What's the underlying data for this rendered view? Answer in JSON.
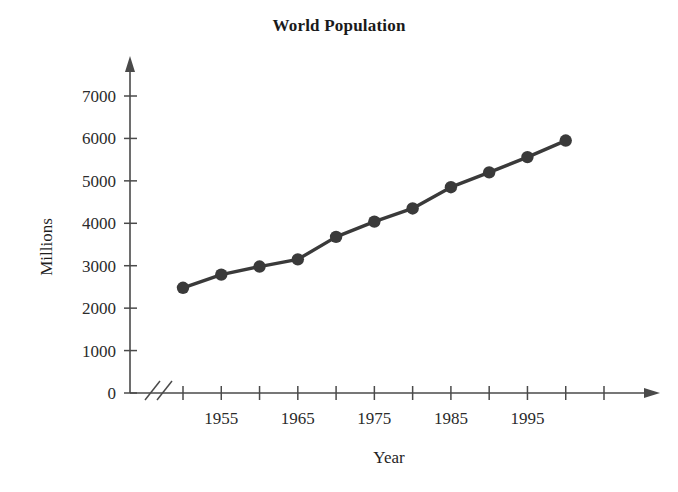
{
  "chart_data": {
    "type": "line",
    "title": "World Population",
    "xlabel": "Year",
    "ylabel": "Millions",
    "x": [
      1950,
      1955,
      1960,
      1965,
      1970,
      1975,
      1980,
      1985,
      1990,
      1995,
      2000
    ],
    "values": [
      2480,
      2790,
      2980,
      3150,
      3680,
      4040,
      4350,
      4850,
      5200,
      5560,
      5950
    ],
    "xlim": [
      1950,
      2005
    ],
    "ylim": [
      0,
      7500
    ],
    "x_tick_values": [
      1950,
      1955,
      1960,
      1965,
      1970,
      1975,
      1980,
      1985,
      1990,
      1995,
      2000,
      2005
    ],
    "x_tick_labels": [
      "",
      "1955",
      "",
      "1965",
      "",
      "1975",
      "",
      "1985",
      "",
      "1995",
      "",
      ""
    ],
    "y_ticks": [
      0,
      1000,
      2000,
      3000,
      4000,
      5000,
      6000,
      7000
    ],
    "y_tick_labels": [
      "0",
      "1000",
      "2000",
      "3000",
      "4000",
      "5000",
      "6000",
      "7000"
    ],
    "grid": false,
    "legend": null,
    "axis_break": "//",
    "marker": "filled-circle",
    "series_color": "#3a3a3a",
    "axis_color": "#4a4a4a"
  }
}
